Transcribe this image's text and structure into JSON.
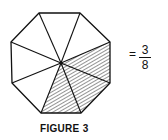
{
  "figure": {
    "caption": "FIGURE 3",
    "shape": "regular octagon",
    "total_sections": 8,
    "shaded_sections": 3,
    "shading": "diagonal-hatch",
    "center": [
      61,
      63
    ],
    "vertices": [
      [
        39,
        13
      ],
      [
        80,
        13
      ],
      [
        110,
        42
      ],
      [
        110,
        83
      ],
      [
        81,
        113
      ],
      [
        41,
        113
      ],
      [
        12,
        83
      ],
      [
        11,
        42
      ]
    ],
    "shaded_section_indices": [
      2,
      3,
      4
    ]
  },
  "equation": {
    "equals": "=",
    "numerator": "3",
    "denominator": "8"
  },
  "colors": {
    "line": "#111111",
    "background": "#ffffff"
  }
}
